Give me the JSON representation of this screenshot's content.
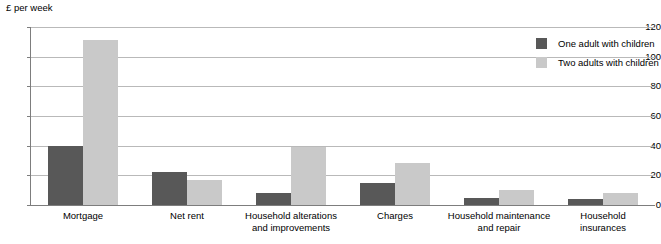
{
  "chart_data": {
    "type": "bar",
    "title": "",
    "subtitle": "",
    "xlabel": "",
    "ylabel": "£ per week",
    "ylim": [
      0,
      120
    ],
    "yticks": [
      0,
      20,
      40,
      60,
      80,
      100,
      120
    ],
    "grid": true,
    "legend_position": "top-right",
    "categories": [
      "Mortgage",
      "Net rent",
      "Household alterations and improvements",
      "Charges",
      "Household maintenance and repair",
      "Household insurances"
    ],
    "category_lines": [
      [
        "Mortgage"
      ],
      [
        "Net rent"
      ],
      [
        "Household alterations",
        "and improvements"
      ],
      [
        "Charges"
      ],
      [
        "Household maintenance",
        "and repair"
      ],
      [
        "Household",
        "insurances"
      ]
    ],
    "series": [
      {
        "name": "One adult with children",
        "color": "#585858",
        "values": [
          40,
          22,
          8,
          15,
          5,
          4
        ]
      },
      {
        "name": "Two adults with children",
        "color": "#c9c9c9",
        "values": [
          111,
          17,
          39,
          28,
          10,
          8
        ]
      }
    ]
  },
  "legend": {
    "items": [
      {
        "label": "One adult with children",
        "swatch": "one-adult"
      },
      {
        "label": "Two adults with children",
        "swatch": "two-adults"
      }
    ]
  },
  "axis": {
    "unit_caption": "£ per week"
  }
}
